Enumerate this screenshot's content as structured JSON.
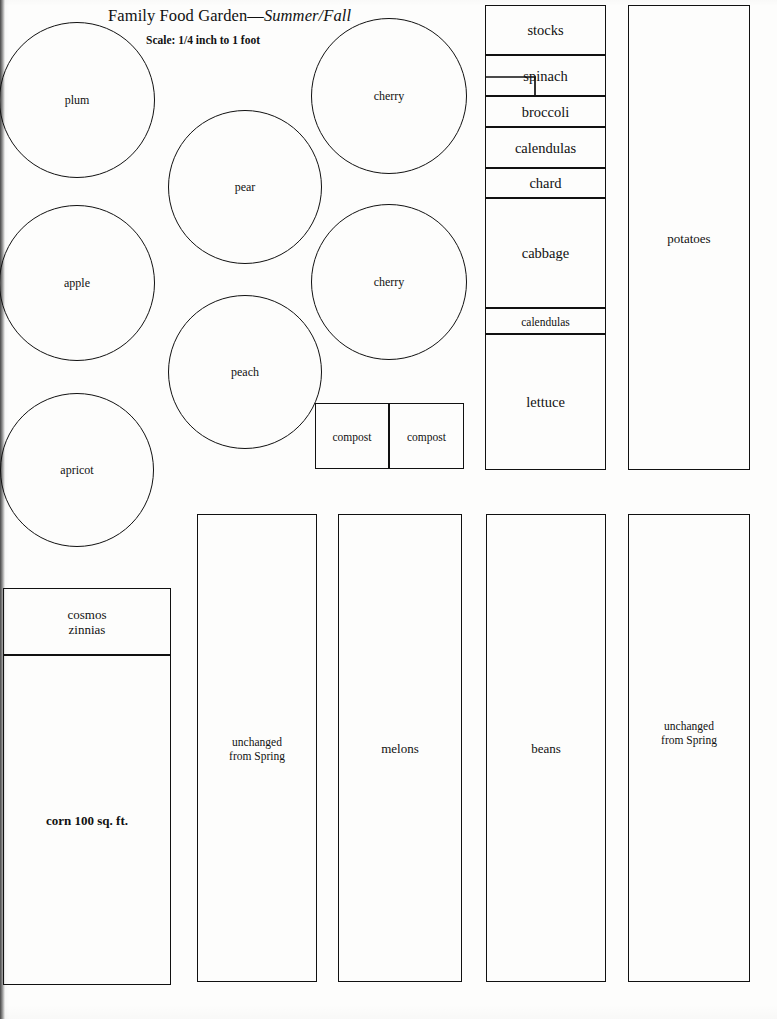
{
  "header": {
    "title_main": "Family Food Garden",
    "title_dash": "—",
    "title_season": "Summer/Fall",
    "scale_note": "Scale: 1/4 inch to 1 foot"
  },
  "trees": [
    {
      "name": "plum",
      "label": "plum",
      "cx": 77,
      "cy": 100,
      "r": 78
    },
    {
      "name": "cherry-top",
      "label": "cherry",
      "cx": 389,
      "cy": 96,
      "r": 78
    },
    {
      "name": "pear",
      "label": "pear",
      "cx": 245,
      "cy": 187,
      "r": 77
    },
    {
      "name": "apple",
      "label": "apple",
      "cx": 77,
      "cy": 283,
      "r": 78
    },
    {
      "name": "cherry-bottom",
      "label": "cherry",
      "cx": 389,
      "cy": 282,
      "r": 78
    },
    {
      "name": "peach",
      "label": "peach",
      "cx": 245,
      "cy": 372,
      "r": 77
    },
    {
      "name": "apricot",
      "label": "apricot",
      "cx": 77,
      "cy": 470,
      "r": 77
    }
  ],
  "beds": [
    {
      "name": "stocks",
      "label": "stocks",
      "x": 485,
      "y": 5,
      "w": 121,
      "h": 50,
      "size": "lg",
      "bold": false,
      "label_offset": 0
    },
    {
      "name": "spinach",
      "label": "spinach",
      "x": 485,
      "y": 55,
      "w": 121,
      "h": 41,
      "size": "lg",
      "bold": false,
      "label_offset": 0,
      "notched": true
    },
    {
      "name": "broccoli",
      "label": "broccoli",
      "x": 485,
      "y": 96,
      "w": 121,
      "h": 31,
      "size": "lg",
      "bold": false,
      "label_offset": 0
    },
    {
      "name": "calendulas-upper",
      "label": "calendulas",
      "x": 485,
      "y": 127,
      "w": 121,
      "h": 41,
      "size": "lg",
      "bold": false,
      "label_offset": 0
    },
    {
      "name": "chard",
      "label": "chard",
      "x": 485,
      "y": 168,
      "w": 121,
      "h": 30,
      "size": "lg",
      "bold": false,
      "label_offset": 0
    },
    {
      "name": "cabbage",
      "label": "cabbage",
      "x": 485,
      "y": 198,
      "w": 121,
      "h": 110,
      "size": "lg",
      "bold": false,
      "label_offset": 0
    },
    {
      "name": "calendulas-lower",
      "label": "calendulas",
      "x": 485,
      "y": 308,
      "w": 121,
      "h": 26,
      "size": "sm",
      "bold": false,
      "label_offset": 0
    },
    {
      "name": "lettuce",
      "label": "lettuce",
      "x": 485,
      "y": 334,
      "w": 121,
      "h": 136,
      "size": "lg",
      "bold": false,
      "label_offset": 0
    },
    {
      "name": "potatoes",
      "label": "potatoes",
      "x": 628,
      "y": 5,
      "w": 122,
      "h": 465,
      "size": "md",
      "bold": false,
      "label_offset": 0
    },
    {
      "name": "compost-left",
      "label": "compost",
      "x": 315,
      "y": 403,
      "w": 74,
      "h": 66,
      "size": "sm",
      "bold": false,
      "label_offset": 0
    },
    {
      "name": "compost-right",
      "label": "compost",
      "x": 389,
      "y": 403,
      "w": 75,
      "h": 66,
      "size": "sm",
      "bold": false,
      "label_offset": 0
    },
    {
      "name": "cosmos-zinnias",
      "label": "cosmos\nzinnias",
      "x": 3,
      "y": 588,
      "w": 168,
      "h": 67,
      "size": "md",
      "bold": false,
      "label_offset": 0
    },
    {
      "name": "corn",
      "label": "corn 100 sq. ft.",
      "x": 3,
      "y": 655,
      "w": 168,
      "h": 330,
      "size": "md",
      "bold": true,
      "label_offset": 0
    },
    {
      "name": "unchanged-spring-1",
      "label": "unchanged\nfrom Spring",
      "x": 197,
      "y": 514,
      "w": 120,
      "h": 468,
      "size": "sm",
      "bold": false,
      "label_offset": 0
    },
    {
      "name": "melons",
      "label": "melons",
      "x": 338,
      "y": 514,
      "w": 124,
      "h": 468,
      "size": "md",
      "bold": false,
      "label_offset": 0
    },
    {
      "name": "beans",
      "label": "beans",
      "x": 486,
      "y": 514,
      "w": 120,
      "h": 468,
      "size": "md",
      "bold": false,
      "label_offset": 0
    },
    {
      "name": "unchanged-spring-2",
      "label": "unchanged\nfrom Spring",
      "x": 628,
      "y": 514,
      "w": 122,
      "h": 468,
      "size": "sm",
      "bold": false,
      "label_offset": -16
    }
  ],
  "notch": {
    "name": "spinach-step-divider",
    "points": "485,77 535,77 535,96 606,96"
  },
  "colors": {
    "ink": "#111111",
    "paper": "#fdfdfc"
  }
}
